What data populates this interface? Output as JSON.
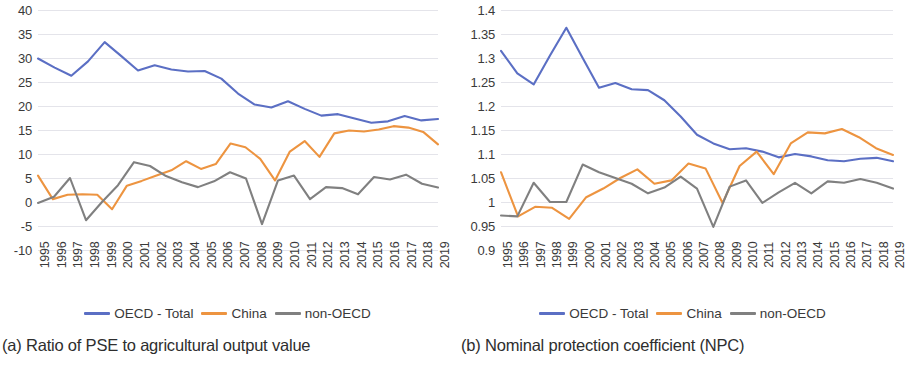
{
  "figure": {
    "panels": [
      {
        "caption": "(a) Ratio of PSE to agricultural output value",
        "legend": [
          {
            "label": "OECD - Total",
            "color": "#5B6FC4"
          },
          {
            "label": "China",
            "color": "#ED9440"
          },
          {
            "label": "non-OECD",
            "color": "#808080"
          }
        ],
        "chart_data": {
          "type": "line",
          "title": "",
          "subtitle": "",
          "xlabel": "",
          "ylabel": "",
          "grid": true,
          "legend_position": "bottom",
          "xlim": [
            1995,
            2019
          ],
          "ylim": [
            -10,
            40
          ],
          "ytick_labels": [
            "40",
            "35",
            "30",
            "25",
            "20",
            "15",
            "10",
            "5",
            "0",
            "-5",
            "-10"
          ],
          "yticks": [
            40,
            35,
            30,
            25,
            20,
            15,
            10,
            5,
            0,
            -5,
            -10
          ],
          "categories": [
            "1995",
            "1996",
            "1997",
            "1998",
            "1999",
            "2000",
            "2001",
            "2002",
            "2003",
            "2004",
            "2005",
            "2006",
            "2007",
            "2008",
            "2009",
            "2010",
            "2011",
            "2012",
            "2013",
            "2014",
            "2015",
            "2016",
            "2017",
            "2018",
            "2019"
          ],
          "x": [
            1995,
            1996,
            1997,
            1998,
            1999,
            2000,
            2001,
            2002,
            2003,
            2004,
            2005,
            2006,
            2007,
            2008,
            2009,
            2010,
            2011,
            2012,
            2013,
            2014,
            2015,
            2016,
            2017,
            2018,
            2019
          ],
          "series": [
            {
              "name": "OECD - Total",
              "color": "#5B6FC4",
              "values": [
                29.9,
                28.0,
                26.3,
                29.3,
                33.3,
                30.4,
                27.4,
                28.5,
                27.6,
                27.2,
                27.3,
                25.7,
                22.6,
                20.3,
                19.7,
                21.0,
                19.4,
                18.0,
                18.3,
                17.4,
                16.5,
                16.8,
                17.9,
                17.0,
                17.3
              ]
            },
            {
              "name": "China",
              "color": "#ED9440",
              "values": [
                5.5,
                0.6,
                1.5,
                1.6,
                1.5,
                -1.5,
                3.4,
                4.4,
                5.5,
                6.6,
                8.5,
                6.9,
                7.9,
                12.2,
                11.4,
                9.0,
                4.5,
                10.5,
                12.7,
                9.4,
                14.3,
                14.9,
                14.7,
                15.1,
                15.8,
                15.5,
                14.6,
                12.0
              ]
            },
            {
              "name": "non-OECD",
              "color": "#808080",
              "values": [
                -0.2,
                1.1,
                5.0,
                -3.8,
                0.0,
                3.5,
                8.3,
                7.5,
                5.4,
                4.1,
                3.1,
                4.3,
                6.2,
                4.9,
                -4.6,
                4.5,
                5.5,
                0.6,
                3.1,
                2.9,
                1.6,
                5.2,
                4.7,
                5.7,
                3.8,
                3.0
              ]
            }
          ]
        }
      },
      {
        "caption": "(b) Nominal protection coefficient (NPC)",
        "legend": [
          {
            "label": "OECD - Total",
            "color": "#5B6FC4"
          },
          {
            "label": "China",
            "color": "#ED9440"
          },
          {
            "label": "non-OECD",
            "color": "#808080"
          }
        ],
        "chart_data": {
          "type": "line",
          "title": "",
          "subtitle": "",
          "xlabel": "",
          "ylabel": "",
          "grid": true,
          "legend_position": "bottom",
          "xlim": [
            1995,
            2019
          ],
          "ylim": [
            0.9,
            1.4
          ],
          "ytick_labels": [
            "1.4",
            "1.35",
            "1.3",
            "1.25",
            "1.2",
            "1.15",
            "1.1",
            "1.05",
            "1",
            "0.95",
            "0.9"
          ],
          "yticks": [
            1.4,
            1.35,
            1.3,
            1.25,
            1.2,
            1.15,
            1.1,
            1.05,
            1.0,
            0.95,
            0.9
          ],
          "categories": [
            "1995",
            "1996",
            "1997",
            "1998",
            "1999",
            "2000",
            "2001",
            "2002",
            "2003",
            "2004",
            "2005",
            "2006",
            "2007",
            "2008",
            "2009",
            "2010",
            "2011",
            "2012",
            "2013",
            "2014",
            "2015",
            "2016",
            "2017",
            "2018",
            "2019"
          ],
          "x": [
            1995,
            1996,
            1997,
            1998,
            1999,
            2000,
            2001,
            2002,
            2003,
            2004,
            2005,
            2006,
            2007,
            2008,
            2009,
            2010,
            2011,
            2012,
            2013,
            2014,
            2015,
            2016,
            2017,
            2018,
            2019
          ],
          "series": [
            {
              "name": "OECD - Total",
              "color": "#5B6FC4",
              "values": [
                1.315,
                1.268,
                1.245,
                1.305,
                1.363,
                1.3,
                1.238,
                1.248,
                1.235,
                1.233,
                1.212,
                1.178,
                1.14,
                1.122,
                1.11,
                1.112,
                1.105,
                1.093,
                1.1,
                1.095,
                1.087,
                1.085,
                1.09,
                1.092,
                1.085
              ]
            },
            {
              "name": "China",
              "color": "#ED9440",
              "values": [
                1.062,
                0.97,
                0.99,
                0.988,
                0.965,
                1.01,
                1.028,
                1.05,
                1.068,
                1.038,
                1.045,
                1.08,
                1.07,
                0.998,
                1.075,
                1.105,
                1.058,
                1.122,
                1.145,
                1.143,
                1.152,
                1.135,
                1.112,
                1.098
              ]
            },
            {
              "name": "non-OECD",
              "color": "#808080",
              "values": [
                0.972,
                0.97,
                1.04,
                1.0,
                1.0,
                1.078,
                1.062,
                1.05,
                1.038,
                1.018,
                1.03,
                1.053,
                1.028,
                0.948,
                1.032,
                1.045,
                0.998,
                1.02,
                1.04,
                1.018,
                1.043,
                1.04,
                1.048,
                1.04,
                1.028
              ]
            }
          ]
        }
      }
    ]
  }
}
